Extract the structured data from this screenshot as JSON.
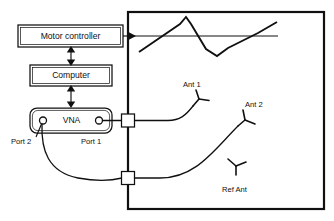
{
  "diagram": {
    "colors": {
      "stroke": "#101010",
      "background": "#ffffff"
    },
    "blocks": [
      {
        "id": "motor_controller",
        "label": "Motor controller"
      },
      {
        "id": "computer",
        "label": "Computer"
      },
      {
        "id": "vna",
        "label": "VNA"
      }
    ],
    "ports": [
      {
        "id": "port2",
        "label": "Port 2"
      },
      {
        "id": "port1",
        "label": "Port 1"
      }
    ],
    "antennas": [
      {
        "id": "ant1",
        "label": "Ant 1"
      },
      {
        "id": "ant2",
        "label": "Ant 2"
      },
      {
        "id": "ref_ant",
        "label": "Ref Ant"
      }
    ],
    "chamber": {
      "name": "anechoic-chamber",
      "rail_name": "positioner-rail-path",
      "drive_arrow_name": "motor-drive-arrow"
    },
    "feedthroughs": [
      {
        "id": "feedthrough_top",
        "label": ""
      },
      {
        "id": "feedthrough_bottom",
        "label": ""
      }
    ]
  }
}
